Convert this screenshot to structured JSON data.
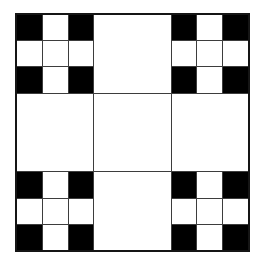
{
  "figure": {
    "grid_size": 3,
    "main_cells": [
      {
        "position": "top-left",
        "type": "subgrid"
      },
      {
        "position": "top-center",
        "type": "plain"
      },
      {
        "position": "top-right",
        "type": "subgrid"
      },
      {
        "position": "middle-left",
        "type": "plain"
      },
      {
        "position": "center",
        "type": "plain"
      },
      {
        "position": "middle-right",
        "type": "plain"
      },
      {
        "position": "bottom-left",
        "type": "subgrid"
      },
      {
        "position": "bottom-center",
        "type": "plain"
      },
      {
        "position": "bottom-right",
        "type": "subgrid"
      }
    ],
    "subgrid_pattern": [
      1,
      0,
      1,
      0,
      0,
      0,
      1,
      0,
      1
    ],
    "colors": {
      "black_cell": "#000000",
      "white_cell": "#ffffff",
      "grid_line": "#3d3d3d",
      "outer_border": "#151515",
      "background": "#ffffff"
    }
  }
}
